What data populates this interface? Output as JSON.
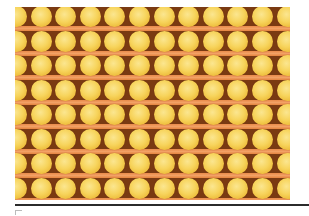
{
  "image": {
    "subject": "grid of yellow spheres on orange-brown background",
    "grid": {
      "rows": 8,
      "columns": 12
    },
    "colors": {
      "sphere": "#f7d45c",
      "sphere_highlight": "#fbe690",
      "band": "#f2a165",
      "gap": "#7a3a12",
      "rule": "#2b2b2b"
    }
  }
}
